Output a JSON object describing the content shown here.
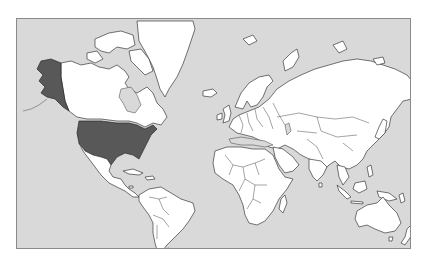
{
  "map": {
    "type": "world-choropleth",
    "projection": "mercator",
    "colors": {
      "ocean": "#d9d9d9",
      "land": "#ffffff",
      "highlight": "#585858",
      "border": "#3a3a3a",
      "frame": "#8a8a8a"
    },
    "highlighted_regions": [
      "United States (contiguous)",
      "Alaska"
    ],
    "regions": [
      {
        "name": "North America",
        "shade": "land"
      },
      {
        "name": "United States",
        "shade": "highlight"
      },
      {
        "name": "Alaska",
        "shade": "highlight"
      },
      {
        "name": "Canada",
        "shade": "land"
      },
      {
        "name": "Greenland",
        "shade": "land"
      },
      {
        "name": "South America",
        "shade": "land"
      },
      {
        "name": "Europe",
        "shade": "land"
      },
      {
        "name": "Africa",
        "shade": "land"
      },
      {
        "name": "Asia",
        "shade": "land"
      },
      {
        "name": "Australia",
        "shade": "land"
      },
      {
        "name": "New Zealand",
        "shade": "land"
      }
    ]
  }
}
